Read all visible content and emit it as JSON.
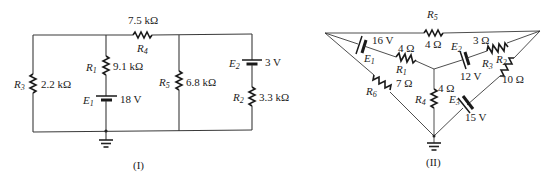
{
  "circuits": [
    {
      "caption": "(I)",
      "components": {
        "R1": {
          "name": "R",
          "sub": "1",
          "value": "9.1 kΩ"
        },
        "R2": {
          "name": "R",
          "sub": "2",
          "value": "3.3 kΩ"
        },
        "R3": {
          "name": "R",
          "sub": "3",
          "value": "2.2 kΩ"
        },
        "R4": {
          "name": "R",
          "sub": "4",
          "value": "7.5 kΩ"
        },
        "R5": {
          "name": "R",
          "sub": "5",
          "value": "6.8 kΩ"
        },
        "E1": {
          "name": "E",
          "sub": "1",
          "value": "18 V"
        },
        "E2": {
          "name": "E",
          "sub": "2",
          "value": "3 V"
        }
      }
    },
    {
      "caption": "(II)",
      "components": {
        "R1": {
          "name": "R",
          "sub": "1",
          "value": "4 Ω"
        },
        "R2": {
          "name": "R",
          "sub": "2",
          "value": "3 Ω"
        },
        "R3": {
          "name": "R",
          "sub": "3",
          "value": "10 Ω"
        },
        "R4": {
          "name": "R",
          "sub": "4",
          "value": "4 Ω"
        },
        "R5": {
          "name": "R",
          "sub": "5",
          "value": "4 Ω"
        },
        "R6": {
          "name": "R",
          "sub": "6",
          "value": "7 Ω"
        },
        "E1": {
          "name": "E",
          "sub": "1",
          "value": "16 V"
        },
        "E2": {
          "name": "E",
          "sub": "2",
          "value": "12 V"
        },
        "E3": {
          "name": "E",
          "sub": "3",
          "value": "15 V"
        }
      }
    }
  ]
}
